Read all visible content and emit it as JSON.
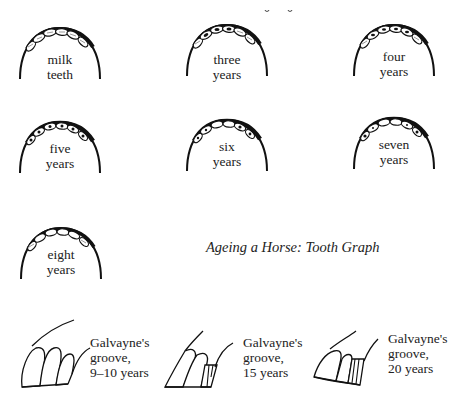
{
  "title": "Ageing a Horse: Tooth Graph",
  "top_fragment": "cropped text (illegible)",
  "jaws": [
    {
      "id": "milk-teeth",
      "line1": "milk",
      "line2": "teeth",
      "pattern": "hatched"
    },
    {
      "id": "three-years",
      "line1": "three",
      "line2": "years",
      "pattern": "mixed-3"
    },
    {
      "id": "four-years",
      "line1": "four",
      "line2": "years",
      "pattern": "mixed-4"
    },
    {
      "id": "five-years",
      "line1": "five",
      "line2": "years",
      "pattern": "cups"
    },
    {
      "id": "six-years",
      "line1": "six",
      "line2": "years",
      "pattern": "six"
    },
    {
      "id": "seven-years",
      "line1": "seven",
      "line2": "years",
      "pattern": "seven"
    },
    {
      "id": "eight-years",
      "line1": "eight",
      "line2": "years",
      "pattern": "eight"
    }
  ],
  "grooves": [
    {
      "id": "groove-9-10",
      "line1": "Galvayne's",
      "line2": "groove,",
      "line3": "9–10 years"
    },
    {
      "id": "groove-15",
      "line1": "Galvayne's",
      "line2": "groove,",
      "line3": "15 years"
    },
    {
      "id": "groove-20",
      "line1": "Galvayne's",
      "line2": "groove,",
      "line3": "20 years"
    }
  ]
}
